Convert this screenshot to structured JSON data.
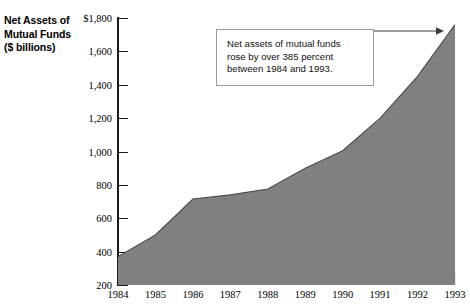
{
  "chart_data": {
    "type": "area",
    "title": "Net Assets of Mutual Funds ($ billions)",
    "title_lines": [
      "Net Assets of",
      "Mutual Funds",
      "($ billions)"
    ],
    "xlabel": "",
    "ylabel": "Net Assets of Mutual Funds ($ billions)",
    "categories": [
      "1984",
      "1985",
      "1986",
      "1987",
      "1988",
      "1989",
      "1990",
      "1991",
      "1992",
      "1993"
    ],
    "values": [
      370,
      500,
      715,
      740,
      775,
      900,
      1005,
      1200,
      1450,
      1760
    ],
    "ylim": [
      200,
      1800
    ],
    "yticks": [
      200,
      400,
      600,
      800,
      1000,
      1200,
      1400,
      1600,
      1800
    ],
    "ytick_labels": [
      "200",
      "400",
      "600",
      "800",
      "1,000",
      "1,200",
      "1,400",
      "1,600",
      "$1,800"
    ],
    "grid": false,
    "legend": "none",
    "fill_color": "#808080",
    "line_color": "#4a4a4a",
    "axis_color": "#1a1a1a",
    "annotations": [
      {
        "id": "growth-callout",
        "text": "Net assets of mutual funds rose by over 385 percent between 1984 and 1993.",
        "lines": [
          "Net assets of mutual funds",
          "rose by over 385 percent",
          "between 1984 and 1993."
        ],
        "points_to": "1993"
      }
    ]
  },
  "axis_title": {
    "line1": "Net Assets of",
    "line2": "Mutual Funds",
    "line3": "($ billions)"
  },
  "callout": {
    "line1": "Net assets of mutual funds",
    "line2": "rose by over 385 percent",
    "line3": "between 1984 and 1993."
  }
}
